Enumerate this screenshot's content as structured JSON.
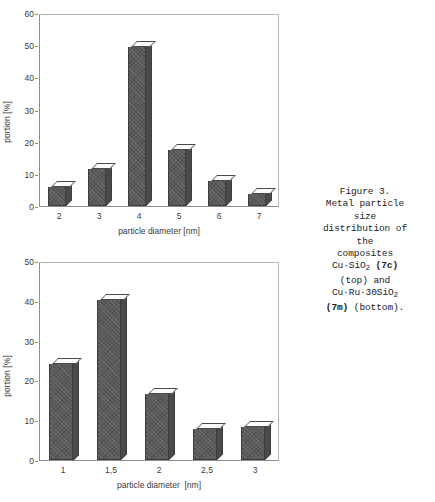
{
  "caption": {
    "lines": [
      "Figure 3.",
      "Metal particle",
      "size",
      "distribution of",
      "the",
      "composites"
    ],
    "formula_top_prefix": "Cu·SiO",
    "formula_top_sub": "2",
    "formula_top_tag": "(7c)",
    "line_top_note": "(top) and",
    "formula_bottom_prefix": "Cu·Ru·30SiO",
    "formula_bottom_sub": "2",
    "formula_bottom_tag": "(7m)",
    "line_bottom_note": "(bottom)."
  },
  "chart_data": [
    {
      "id": "top",
      "type": "bar",
      "title": "",
      "xlabel": "particle diameter [nm]",
      "ylabel": "portion [%]",
      "categories": [
        "2",
        "3",
        "4",
        "5",
        "6",
        "7"
      ],
      "values": [
        6,
        12,
        51,
        18,
        8,
        4
      ],
      "ylim": [
        0,
        60
      ],
      "yticks": [
        0,
        10,
        20,
        30,
        40,
        50,
        60
      ],
      "grid": false,
      "legend": "none",
      "bar_color": "#595959",
      "bar_top_color": "#fbfbfb"
    },
    {
      "id": "bottom",
      "type": "bar",
      "title": "",
      "xlabel": "particle diameter  [nm]",
      "ylabel": "portion [%]",
      "categories": [
        "1",
        "1,5",
        "2",
        "2,5",
        "3"
      ],
      "values": [
        25,
        41.5,
        17,
        8,
        8.5
      ],
      "seams": [
        {
          "category": "1,5",
          "at": [
            34,
            26
          ]
        }
      ],
      "ylim": [
        0,
        50
      ],
      "yticks": [
        0,
        10,
        20,
        30,
        40,
        50
      ],
      "grid": false,
      "legend": "none",
      "bar_color": "#595959",
      "bar_top_color": "#fbfbfb"
    }
  ]
}
